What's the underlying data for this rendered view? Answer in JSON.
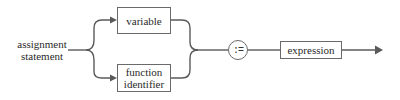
{
  "diagram": {
    "type": "syntax-diagram",
    "start": {
      "label_line1": "assignment",
      "label_line2": "statement"
    },
    "branches": [
      {
        "label_line1": "variable",
        "label_line2": ""
      },
      {
        "label_line1": "function",
        "label_line2": "identifier"
      }
    ],
    "operator": ":=",
    "terminal": {
      "label": "expression"
    },
    "colors": {
      "line": "#5a5a5a",
      "text": "#2a2a2a",
      "background": "#ffffff"
    }
  }
}
